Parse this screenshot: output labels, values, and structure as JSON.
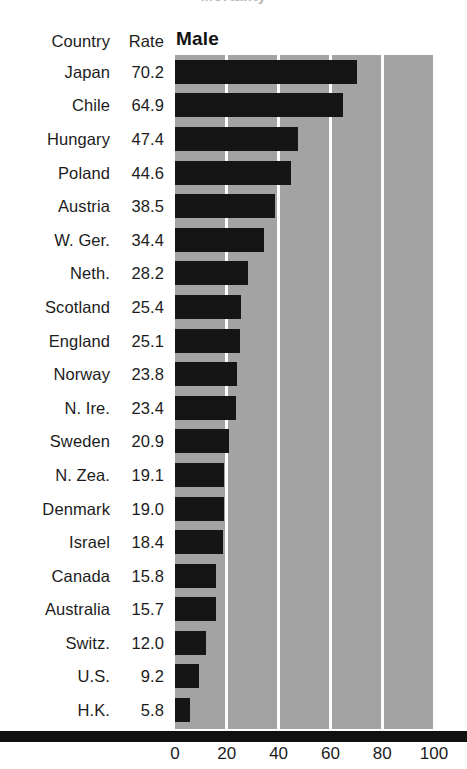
{
  "figure": {
    "clipped_title_remnant": "Mortality",
    "panel_title": "Male"
  },
  "table_headers": {
    "country": "Country",
    "rate": "Rate"
  },
  "axis": {
    "ticks": [
      "0",
      "20",
      "40",
      "60",
      "80",
      "100"
    ],
    "tick_values": [
      0,
      20,
      40,
      60,
      80,
      100
    ],
    "min": 0,
    "max": 100
  },
  "colors": {
    "bar": "#151515",
    "panel_background": "#a3a3a3",
    "gridline": "#fdfdfd",
    "axis_bar": "#111111",
    "text": "#1c1c1c",
    "page_background": "#ffffff"
  },
  "chart_data": {
    "type": "bar",
    "orientation": "horizontal",
    "title": "Male",
    "xlabel": "",
    "ylabel": "",
    "xlim": [
      0,
      100
    ],
    "grid": true,
    "legend": "none",
    "categories": [
      "Japan",
      "Chile",
      "Hungary",
      "Poland",
      "Austria",
      "W. Ger.",
      "Neth.",
      "Scotland",
      "England",
      "Norway",
      "N. Ire.",
      "Sweden",
      "N. Zea.",
      "Denmark",
      "Israel",
      "Canada",
      "Australia",
      "Switz.",
      "U.S.",
      "H.K."
    ],
    "values": [
      70.2,
      64.9,
      47.4,
      44.6,
      38.5,
      34.4,
      28.2,
      25.4,
      25.1,
      23.8,
      23.4,
      20.9,
      19.1,
      19.0,
      18.4,
      15.8,
      15.7,
      12.0,
      9.2,
      5.8
    ],
    "value_labels": [
      "70.2",
      "64.9",
      "47.4",
      "44.6",
      "38.5",
      "34.4",
      "28.2",
      "25.4",
      "25.1",
      "23.8",
      "23.4",
      "20.9",
      "19.1",
      "19.0",
      "18.4",
      "15.8",
      "15.7",
      "12.0",
      "9.2",
      "5.8"
    ],
    "xticks": [
      0,
      20,
      40,
      60,
      80,
      100
    ],
    "xticklabels": [
      "0",
      "20",
      "40",
      "60",
      "80",
      "100"
    ]
  }
}
